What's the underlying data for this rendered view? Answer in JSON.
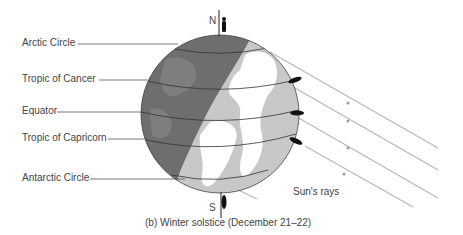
{
  "labels": {
    "arctic_circle": "Arctic Circle",
    "tropic_cancer": "Tropic of Cancer",
    "equator": "Equator",
    "tropic_capricorn": "Tropic of Capricorn",
    "antarctic_circle": "Antarctic Circle",
    "north": "N",
    "south": "S",
    "suns_rays": "Sun's rays"
  },
  "caption": "(b)  Winter solstice (December 21–22)",
  "colors": {
    "night_side": "#6e6e6e",
    "night_land": "#858585",
    "day_ocean": "#c8c8c8",
    "day_land": "#ffffff",
    "ray_line": "#b8b8b8",
    "leader_line": "#555555",
    "person": "#111111"
  }
}
